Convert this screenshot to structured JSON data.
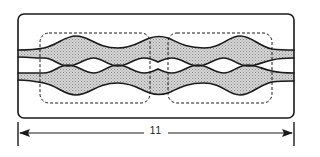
{
  "diagram": {
    "type": "technical-illustration",
    "outer_box": {
      "shape": "rounded-rectangle",
      "stroke": "solid"
    },
    "regions": [
      {
        "id": "left-region",
        "shape": "rounded-rectangle",
        "stroke": "dashed"
      },
      {
        "id": "right-region",
        "shape": "rounded-rectangle",
        "stroke": "dashed"
      }
    ],
    "channels": [
      {
        "id": "upper-channel",
        "fill": "stippled-gray",
        "boundary": "wavy"
      },
      {
        "id": "lower-channel",
        "fill": "stippled-gray",
        "boundary": "wavy"
      }
    ],
    "dimension": {
      "label": "11",
      "orientation": "horizontal",
      "arrowheads": "both-ends"
    }
  },
  "colors": {
    "stroke": "#1a1a1a",
    "fill": "#c8c8c8",
    "background": "#ffffff"
  }
}
